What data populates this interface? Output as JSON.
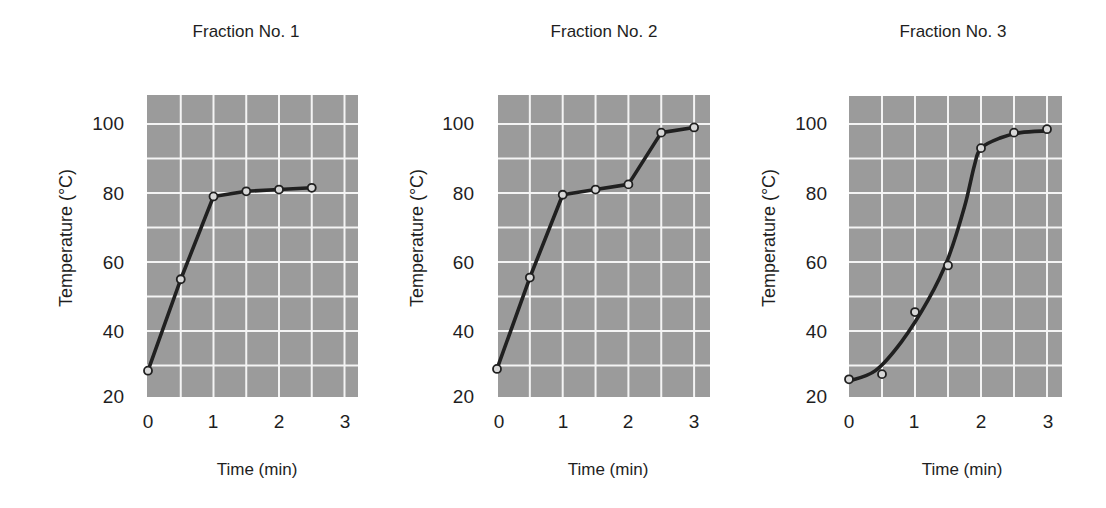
{
  "figure": {
    "colors": {
      "panel": "#9b9b9b",
      "grid": "#f4f4f4",
      "line": "#202020",
      "marker_fill": "#d8d8d8"
    }
  },
  "chart_data": [
    {
      "type": "line",
      "title": "Fraction No. 1",
      "xlabel": "Time (min)",
      "ylabel": "Temperature (°C)",
      "xticks": [
        "0",
        "1",
        "2",
        "3"
      ],
      "yticks": [
        "20",
        "40",
        "60",
        "80",
        "100"
      ],
      "xlim": [
        0,
        3.2
      ],
      "ylim": [
        20,
        108
      ],
      "grid": true,
      "grid_step": {
        "x": 0.5,
        "y": 10
      },
      "smooth": false,
      "series": [
        {
          "name": "Fraction No. 1",
          "x": [
            0,
            0.5,
            1,
            1.5,
            2,
            2.5
          ],
          "y": [
            28.5,
            55,
            79,
            80.5,
            81,
            81.5
          ]
        }
      ]
    },
    {
      "type": "line",
      "title": "Fraction No. 2",
      "xlabel": "Time (min)",
      "ylabel": "Temperature (°C)",
      "xticks": [
        "0",
        "1",
        "2",
        "3"
      ],
      "yticks": [
        "20",
        "40",
        "60",
        "80",
        "100"
      ],
      "xlim": [
        0,
        3.2
      ],
      "ylim": [
        20,
        108
      ],
      "grid": true,
      "grid_step": {
        "x": 0.5,
        "y": 10
      },
      "smooth": false,
      "series": [
        {
          "name": "Fraction No. 2",
          "x": [
            0,
            0.5,
            1,
            1.5,
            2,
            2.5,
            3
          ],
          "y": [
            29,
            55.5,
            79.5,
            81,
            82.5,
            97.5,
            99
          ]
        }
      ]
    },
    {
      "type": "line",
      "title": "Fraction No. 3",
      "xlabel": "Time (min)",
      "ylabel": "Temperature (°C)",
      "xticks": [
        "0",
        "1",
        "2",
        "3"
      ],
      "yticks": [
        "20",
        "40",
        "60",
        "80",
        "100"
      ],
      "xlim": [
        0,
        3.2
      ],
      "ylim": [
        20,
        108
      ],
      "grid": true,
      "grid_step": {
        "x": 0.5,
        "y": 10
      },
      "smooth": true,
      "series": [
        {
          "name": "Fraction No. 3",
          "x": [
            0,
            0.5,
            1,
            1.5,
            2,
            2.5,
            3
          ],
          "y": [
            26,
            27.5,
            45.5,
            59,
            93,
            97.5,
            98.5
          ]
        }
      ],
      "fit_curve": {
        "x": [
          0,
          0.4,
          0.8,
          1.2,
          1.5,
          1.75,
          1.9,
          2.0,
          2.3,
          2.6,
          3.0
        ],
        "y": [
          25.5,
          28.5,
          37,
          49,
          61,
          76,
          88,
          93,
          96,
          97.5,
          98
        ]
      }
    }
  ]
}
